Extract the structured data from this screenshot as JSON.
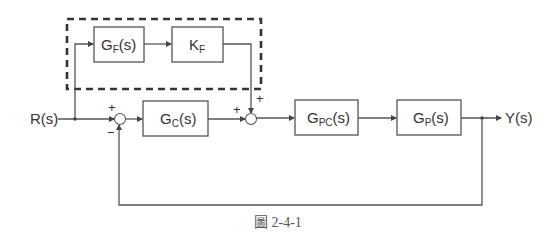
{
  "diagram": {
    "input_label": "R(s)",
    "output_label": "Y(s)",
    "caption": "圖 2-4-1",
    "blocks": {
      "gf": {
        "main": "G",
        "sub": "F",
        "tail": "(s)"
      },
      "kf": {
        "main": "K",
        "sub": "F",
        "tail": ""
      },
      "gc": {
        "main": "G",
        "sub": "C",
        "tail": "(s)"
      },
      "gpc": {
        "main": "G",
        "sub": "PC",
        "tail": "(s)"
      },
      "gp": {
        "main": "G",
        "sub": "P",
        "tail": "(s)"
      }
    },
    "summer1": {
      "top_sign": "+",
      "bottom_sign": "−"
    },
    "summer2": {
      "left_sign": "+",
      "top_sign": "+"
    },
    "feedforward_group": "dashed-box"
  }
}
